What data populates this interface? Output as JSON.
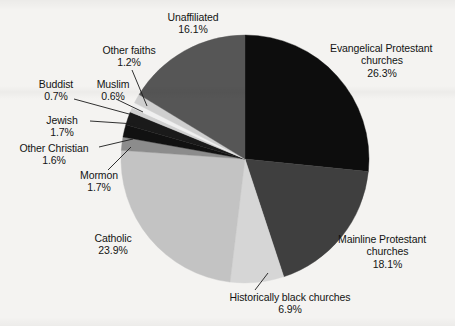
{
  "chart_data": {
    "type": "pie",
    "title": "",
    "subtitle": "",
    "xlabel": "",
    "ylabel": "",
    "legend_position": "none",
    "grid": false,
    "units": "percent",
    "start_angle_deg": 0,
    "direction": "clockwise",
    "categories": [
      "Evangelical Protestant churches",
      "Mainline Protestant churches",
      "Historically black churches",
      "Catholic",
      "Mormon",
      "Other Christian",
      "Jewish",
      "Muslim",
      "Buddist",
      "Other faiths",
      "Unaffiliated"
    ],
    "values": [
      26.3,
      18.1,
      6.9,
      23.9,
      1.7,
      1.6,
      1.7,
      0.6,
      0.7,
      1.2,
      16.1
    ],
    "colors": [
      "#0d0d0d",
      "#3f3f3f",
      "#d6d6d6",
      "#c3c3c3",
      "#8c8c8c",
      "#111111",
      "#1a1a1a",
      "#d0d0d0",
      "#f0f0f0",
      "#cfcfcf",
      "#565656"
    ],
    "slices": [
      {
        "label": "Evangelical Protestant churches",
        "value": 26.3,
        "value_text": "26.3%",
        "color": "#0d0d0d"
      },
      {
        "label": "Mainline Protestant churches",
        "value": 18.1,
        "value_text": "18.1%",
        "color": "#3f3f3f"
      },
      {
        "label": "Historically black churches",
        "value": 6.9,
        "value_text": "6.9%",
        "color": "#d6d6d6"
      },
      {
        "label": "Catholic",
        "value": 23.9,
        "value_text": "23.9%",
        "color": "#c3c3c3"
      },
      {
        "label": "Mormon",
        "value": 1.7,
        "value_text": "1.7%",
        "color": "#8c8c8c"
      },
      {
        "label": "Other Christian",
        "value": 1.6,
        "value_text": "1.6%",
        "color": "#111111"
      },
      {
        "label": "Jewish",
        "value": 1.7,
        "value_text": "1.7%",
        "color": "#1a1a1a"
      },
      {
        "label": "Muslim",
        "value": 0.6,
        "value_text": "0.6%",
        "color": "#d0d0d0"
      },
      {
        "label": "Buddist",
        "value": 0.7,
        "value_text": "0.7%",
        "color": "#f0f0f0"
      },
      {
        "label": "Other faiths",
        "value": 1.2,
        "value_text": "1.2%",
        "color": "#cfcfcf"
      },
      {
        "label": "Unaffiliated",
        "value": 16.1,
        "value_text": "16.1%",
        "color": "#565656"
      }
    ]
  },
  "labels": {
    "evangelical": {
      "line1": "Evangelical Protestant",
      "line2": "churches",
      "value": "26.3%"
    },
    "mainline": {
      "line1": "Mainline Protestant",
      "line2": "churches",
      "value": "18.1%"
    },
    "historically_black": {
      "line1": "Historically black churches",
      "value": "6.9%"
    },
    "catholic": {
      "line1": "Catholic",
      "value": "23.9%"
    },
    "mormon": {
      "line1": "Mormon",
      "value": "1.7%"
    },
    "other_christian": {
      "line1": "Other Christian",
      "value": "1.6%"
    },
    "jewish": {
      "line1": "Jewish",
      "value": "1.7%"
    },
    "buddist": {
      "line1": "Buddist",
      "value": "0.7%"
    },
    "muslim": {
      "line1": "Muslim",
      "value": "0.6%"
    },
    "other_faiths": {
      "line1": "Other faiths",
      "value": "1.2%"
    },
    "unaffiliated": {
      "line1": "Unaffiliated",
      "value": "16.1%"
    }
  },
  "style": {
    "background": "#f4f3f1",
    "text_color": "#131313",
    "leader_line_color": "#1a1a1a",
    "pie_center_x": 245,
    "pie_center_y": 159,
    "pie_radius": 124
  }
}
